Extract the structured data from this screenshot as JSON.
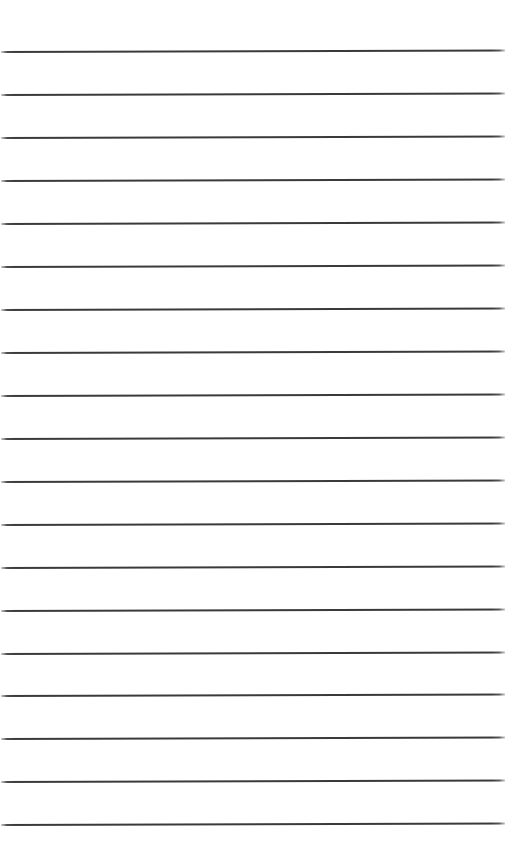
{
  "page": {
    "type": "lined-paper",
    "background_color": "#ffffff",
    "line_color": "#3a3a3a",
    "line_thickness_px": 2,
    "line_count": 19,
    "first_line_y": 51,
    "line_spacing_px": 42.95
  },
  "lines": [
    {
      "index": 1,
      "y": 51
    },
    {
      "index": 2,
      "y": 94
    },
    {
      "index": 3,
      "y": 137
    },
    {
      "index": 4,
      "y": 180
    },
    {
      "index": 5,
      "y": 223
    },
    {
      "index": 6,
      "y": 266
    },
    {
      "index": 7,
      "y": 309
    },
    {
      "index": 8,
      "y": 352
    },
    {
      "index": 9,
      "y": 395
    },
    {
      "index": 10,
      "y": 438
    },
    {
      "index": 11,
      "y": 481
    },
    {
      "index": 12,
      "y": 524
    },
    {
      "index": 13,
      "y": 567
    },
    {
      "index": 14,
      "y": 610
    },
    {
      "index": 15,
      "y": 653
    },
    {
      "index": 16,
      "y": 695
    },
    {
      "index": 17,
      "y": 738
    },
    {
      "index": 18,
      "y": 781
    },
    {
      "index": 19,
      "y": 824
    }
  ]
}
